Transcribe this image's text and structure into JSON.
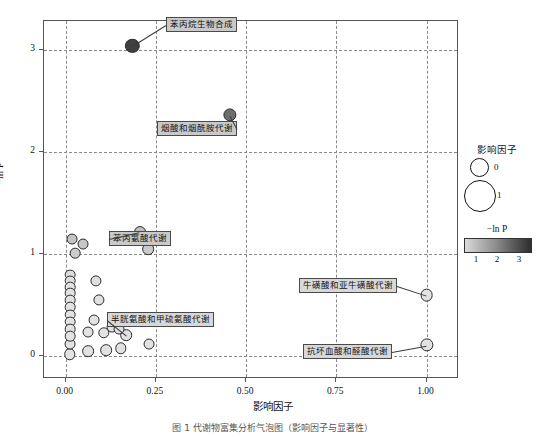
{
  "axes": {
    "x_title": "影响因子",
    "y_title": "−ln P",
    "x_ticks": [
      "0.00",
      "0.25",
      "0.50",
      "0.75",
      "1.00"
    ],
    "y_ticks": [
      "0",
      "1",
      "2",
      "3"
    ]
  },
  "legend": {
    "size_title": "影响因子",
    "size_labels": [
      "0",
      "1"
    ],
    "color_title": "−ln P",
    "color_ticks": [
      "1",
      "2",
      "3"
    ],
    "color_low": "#dcdcdc",
    "color_high": "#2f2f2f"
  },
  "annotations": [
    {
      "text": "苯丙烷生物合成"
    },
    {
      "text": "烟酸和烟酰胺代谢"
    },
    {
      "text": "苯丙氨酸代谢"
    },
    {
      "text": "半胱氨酸和甲硫氨酸代谢"
    },
    {
      "text": "牛磺酸和亚牛磺酸代谢"
    },
    {
      "text": "抗坏血酸和醛酸代谢"
    }
  ],
  "caption": "图 1   代谢物富集分析气泡图（影响因子与显著性）",
  "chart_data": {
    "type": "scatter",
    "title": "",
    "xlabel": "影响因子",
    "ylabel": "−ln P",
    "xlim": [
      -0.06,
      1.09
    ],
    "ylim": [
      -0.22,
      3.28
    ],
    "grid": true,
    "xticks": [
      0.0,
      0.25,
      0.5,
      0.75,
      1.0
    ],
    "yticks": [
      0,
      1,
      2,
      3
    ],
    "size_encodes": "影响因子",
    "color_encodes": "−ln P",
    "color_range": [
      0.7,
      3.05
    ],
    "legend_position": "right-outside",
    "points": [
      {
        "label": "苯丙烷生物合成",
        "x": 0.185,
        "y": 3.04,
        "size": 0.3,
        "color_value": 3.04
      },
      {
        "label": "烟酸和烟酰胺代谢",
        "x": 0.455,
        "y": 2.36,
        "size": 0.26,
        "color_value": 2.36
      },
      {
        "label": "苯丙氨酸代谢",
        "x": 0.205,
        "y": 1.22,
        "size": 0.21,
        "color_value": 1.22
      },
      {
        "label": "",
        "x": 0.155,
        "y": 1.16,
        "size": 0.18,
        "color_value": 1.16
      },
      {
        "label": "",
        "x": 0.228,
        "y": 1.05,
        "size": 0.2,
        "color_value": 1.05
      },
      {
        "label": "",
        "x": 0.018,
        "y": 1.15,
        "size": 0.17,
        "color_value": 1.15
      },
      {
        "label": "",
        "x": 0.047,
        "y": 1.1,
        "size": 0.17,
        "color_value": 1.1
      },
      {
        "label": "",
        "x": 0.027,
        "y": 1.01,
        "size": 0.16,
        "color_value": 1.01
      },
      {
        "label": "",
        "x": 0.012,
        "y": 0.8,
        "size": 0.16,
        "color_value": 0.8
      },
      {
        "label": "",
        "x": 0.012,
        "y": 0.74,
        "size": 0.16,
        "color_value": 0.74
      },
      {
        "label": "",
        "x": 0.012,
        "y": 0.68,
        "size": 0.16,
        "color_value": 0.68
      },
      {
        "label": "",
        "x": 0.012,
        "y": 0.62,
        "size": 0.16,
        "color_value": 0.62
      },
      {
        "label": "",
        "x": 0.012,
        "y": 0.55,
        "size": 0.16,
        "color_value": 0.55
      },
      {
        "label": "",
        "x": 0.012,
        "y": 0.48,
        "size": 0.16,
        "color_value": 0.48
      },
      {
        "label": "",
        "x": 0.012,
        "y": 0.41,
        "size": 0.16,
        "color_value": 0.41
      },
      {
        "label": "",
        "x": 0.012,
        "y": 0.34,
        "size": 0.16,
        "color_value": 0.34
      },
      {
        "label": "",
        "x": 0.012,
        "y": 0.27,
        "size": 0.16,
        "color_value": 0.27
      },
      {
        "label": "",
        "x": 0.012,
        "y": 0.2,
        "size": 0.16,
        "color_value": 0.2
      },
      {
        "label": "",
        "x": 0.012,
        "y": 0.12,
        "size": 0.17,
        "color_value": 0.12
      },
      {
        "label": "",
        "x": 0.012,
        "y": 0.02,
        "size": 0.19,
        "color_value": 0.02
      },
      {
        "label": "",
        "x": 0.085,
        "y": 0.74,
        "size": 0.18,
        "color_value": 0.74
      },
      {
        "label": "",
        "x": 0.092,
        "y": 0.55,
        "size": 0.18,
        "color_value": 0.55
      },
      {
        "label": "",
        "x": 0.078,
        "y": 0.36,
        "size": 0.17,
        "color_value": 0.36
      },
      {
        "label": "",
        "x": 0.063,
        "y": 0.24,
        "size": 0.17,
        "color_value": 0.24
      },
      {
        "label": "",
        "x": 0.105,
        "y": 0.23,
        "size": 0.19,
        "color_value": 0.23
      },
      {
        "label": "",
        "x": 0.128,
        "y": 0.29,
        "size": 0.17,
        "color_value": 0.29
      },
      {
        "label": "",
        "x": 0.148,
        "y": 0.27,
        "size": 0.17,
        "color_value": 0.27
      },
      {
        "label": "半胱氨酸和甲硫氨酸代谢",
        "x": 0.168,
        "y": 0.21,
        "size": 0.2,
        "color_value": 0.21
      },
      {
        "label": "",
        "x": 0.063,
        "y": 0.05,
        "size": 0.2,
        "color_value": 0.05
      },
      {
        "label": "",
        "x": 0.112,
        "y": 0.06,
        "size": 0.2,
        "color_value": 0.06
      },
      {
        "label": "",
        "x": 0.152,
        "y": 0.08,
        "size": 0.19,
        "color_value": 0.08
      },
      {
        "label": "",
        "x": 0.232,
        "y": 0.12,
        "size": 0.17,
        "color_value": 0.12
      },
      {
        "label": "牛磺酸和亚牛磺酸代谢",
        "x": 1.0,
        "y": 0.6,
        "size": 0.24,
        "color_value": 0.6
      },
      {
        "label": "抗坏血酸和醛酸代谢",
        "x": 1.0,
        "y": 0.11,
        "size": 0.26,
        "color_value": 0.11
      }
    ]
  }
}
